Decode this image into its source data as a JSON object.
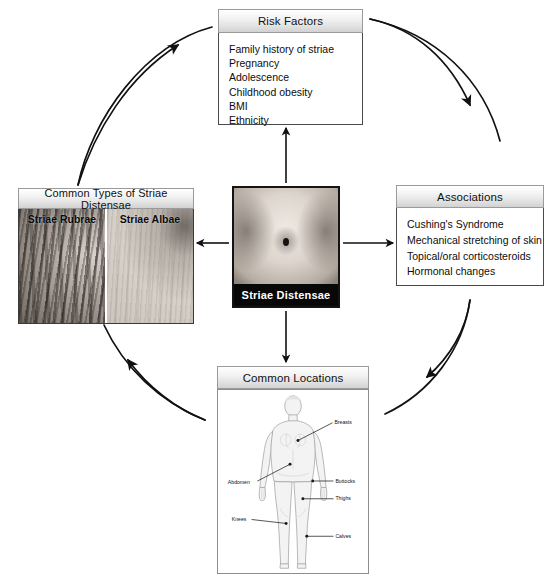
{
  "diagram": {
    "title": "Striae Distensae",
    "layout": "radial hub-and-spoke with clockwise circular arrows",
    "colors": {
      "header_gradient_top": "#ffffff",
      "header_gradient_bottom": "#d2d2d2",
      "border": "#4a4a4a",
      "center_caption_bg": "#080808",
      "center_caption_text": "#ffffff",
      "canvas_bg": "#ffffff"
    }
  },
  "center": {
    "caption": "Striae Distensae",
    "image_alt": "abdomen-photo"
  },
  "risk_factors": {
    "title": "Risk Factors",
    "items": [
      "Family history of striae",
      "Pregnancy",
      "Adolescence",
      "Childhood obesity",
      "BMI",
      "Ethnicity"
    ]
  },
  "associations": {
    "title": "Associations",
    "items": [
      "Cushing's Syndrome",
      "Mechanical stretching of skin",
      "Topical/oral corticosteroids",
      "Hormonal changes"
    ]
  },
  "common_types": {
    "title": "Common Types of Striae Distensae",
    "panels": [
      {
        "label": "Striae Rubrae",
        "image_alt": "striae-rubrae-photo"
      },
      {
        "label": "Striae Albae",
        "image_alt": "striae-albae-photo"
      }
    ]
  },
  "common_locations": {
    "title": "Common Locations",
    "image_alt": "female-body-diagram",
    "labels": [
      "Breasts",
      "Buttocks",
      "Thighs",
      "Abdomen",
      "Knees",
      "Calves"
    ]
  }
}
